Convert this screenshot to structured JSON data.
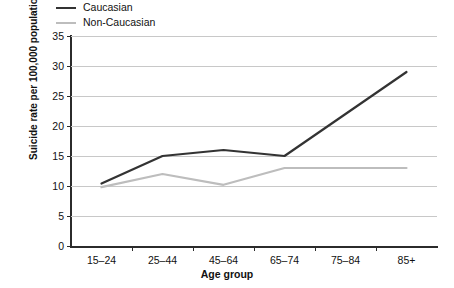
{
  "chart_data": {
    "type": "line",
    "title": "",
    "xlabel": "Age group",
    "ylabel": "Suicide rate per 100,000 population",
    "categories": [
      "15–24",
      "25–44",
      "45–64",
      "65–74",
      "75–84",
      "85+"
    ],
    "series": [
      {
        "name": "Caucasian",
        "color": "#333333",
        "values": [
          10.4,
          15.0,
          16.0,
          15.0,
          22.0,
          29.0
        ]
      },
      {
        "name": "Non-Caucasian",
        "color": "#bdbdbd",
        "values": [
          9.8,
          12.0,
          10.2,
          13.0,
          13.0,
          13.0
        ]
      }
    ],
    "ylim": [
      0,
      35
    ],
    "yticks": [
      0,
      5,
      10,
      15,
      20,
      25,
      30,
      35
    ],
    "ytick_labels": [
      "0",
      "5",
      "10",
      "15",
      "20",
      "25",
      "30",
      "35"
    ],
    "grid": true,
    "legend_position": "top-left"
  },
  "legend": {
    "items": [
      {
        "label": "Caucasian"
      },
      {
        "label": "Non-Caucasian"
      }
    ]
  },
  "axes": {
    "x_title": "Age group",
    "y_title": "Suicide rate per 100,000 population"
  }
}
